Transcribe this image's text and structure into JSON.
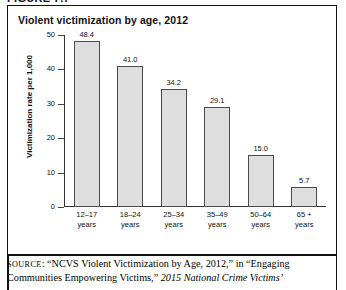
{
  "figure": {
    "label": "FIGURE 7.7"
  },
  "chart_title": "Violent victimization by age, 2012",
  "chart_data": {
    "type": "bar",
    "title": "Violent victimization by age, 2012",
    "xlabel": "",
    "ylabel": "Victimization rate per 1,000",
    "categories": [
      "12–17 years",
      "18–24 years",
      "25–34 years",
      "35–49 years",
      "50–64 years",
      "65 + years"
    ],
    "category_lines": [
      {
        "line1": "12–17",
        "line2": "years"
      },
      {
        "line1": "18–24",
        "line2": "years"
      },
      {
        "line1": "25–34",
        "line2": "years"
      },
      {
        "line1": "35–49",
        "line2": "years"
      },
      {
        "line1": "50–64",
        "line2": "years"
      },
      {
        "line1": "65 +",
        "line2": "years"
      }
    ],
    "values": [
      48.4,
      41.0,
      34.2,
      29.1,
      15.0,
      5.7
    ],
    "value_labels": [
      "48.4",
      "41.0",
      "34.2",
      "29.1",
      "15.0",
      "5.7"
    ],
    "ylim": [
      0,
      50
    ],
    "yticks": [
      0,
      10,
      20,
      30,
      40,
      50
    ],
    "ytick_labels": [
      "0",
      "10",
      "20",
      "30",
      "40",
      "50"
    ],
    "grid": false,
    "legend": "none",
    "bar_fill": "#dedede",
    "bar_stroke": "#4a4a4a"
  },
  "source": {
    "prefix": "SOURCE",
    "line1_rest": ": “NCVS Violent Victimization by Age, 2012,” in “Engaging ",
    "line2_plain": "Communities Empowering Victims,” ",
    "line2_italic": "2015 National Crime Victims’"
  }
}
